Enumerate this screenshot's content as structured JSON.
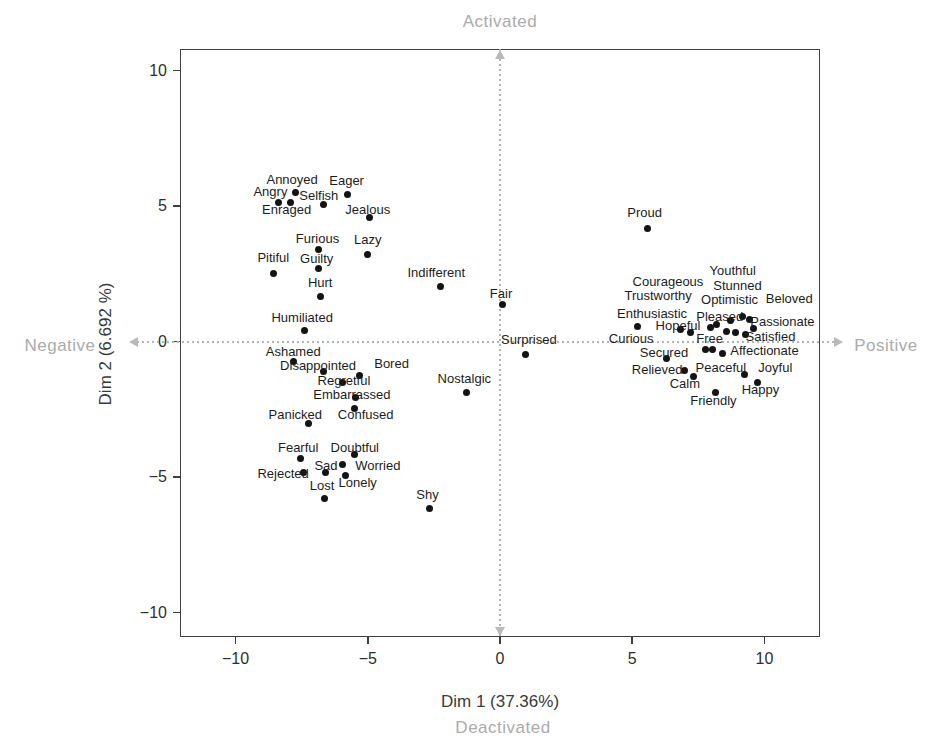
{
  "colors": {
    "point": "#141414",
    "point_label": "#1c1c1c",
    "axis_title": "#3a3a3a",
    "tick_label": "#2e2e2e",
    "quadrant_label": "#ababab",
    "crosshair": "#b4b4b4",
    "plot_border": "#3f3f3f",
    "background": "#ffffff"
  },
  "chart_data": {
    "type": "scatter",
    "title": "",
    "xlabel": "Dim 1 (37.36%)",
    "ylabel": "Dim 2 (6.692 %)",
    "xlim": [
      -12.1,
      12.1
    ],
    "ylim": [
      -10.9,
      10.8
    ],
    "grid": false,
    "quadrant_labels": {
      "top": "Activated",
      "bottom": "Deactivated",
      "left": "Negative",
      "right": "Positive"
    },
    "x_ticks": [
      {
        "v": -10,
        "label": "−10"
      },
      {
        "v": -5,
        "label": "−5"
      },
      {
        "v": 0,
        "label": "0"
      },
      {
        "v": 5,
        "label": "5"
      },
      {
        "v": 10,
        "label": "10"
      }
    ],
    "y_ticks": [
      {
        "v": -10,
        "label": "−10"
      },
      {
        "v": -5,
        "label": "−5"
      },
      {
        "v": 0,
        "label": "0"
      },
      {
        "v": 5,
        "label": "5"
      },
      {
        "v": 10,
        "label": "10"
      }
    ],
    "points": [
      {
        "label": "Annoyed",
        "x": -7.74,
        "y": 5.49,
        "lx": -7.86,
        "ly": 6.0
      },
      {
        "label": "Eager",
        "x": -5.75,
        "y": 5.42,
        "lx": -5.8,
        "ly": 5.95
      },
      {
        "label": "Angry",
        "x": -8.38,
        "y": 5.13,
        "lx": -8.68,
        "ly": 5.55
      },
      {
        "label": "Enraged",
        "x": -7.93,
        "y": 5.13,
        "lx": -8.07,
        "ly": 4.88
      },
      {
        "label": "Selfish",
        "x": -6.69,
        "y": 5.05,
        "lx": -6.85,
        "ly": 5.4
      },
      {
        "label": "Jealous",
        "x": -4.92,
        "y": 4.58,
        "lx": -5.0,
        "ly": 4.88
      },
      {
        "label": "Furious",
        "x": -6.88,
        "y": 3.41,
        "lx": -6.9,
        "ly": 3.82
      },
      {
        "label": "Lazy",
        "x": -5.0,
        "y": 3.22,
        "lx": -5.0,
        "ly": 3.78
      },
      {
        "label": "Pitiful",
        "x": -8.57,
        "y": 2.53,
        "lx": -8.57,
        "ly": 3.12
      },
      {
        "label": "Guilty",
        "x": -6.88,
        "y": 2.71,
        "lx": -6.93,
        "ly": 3.08
      },
      {
        "label": "Hurt",
        "x": -6.77,
        "y": 1.68,
        "lx": -6.8,
        "ly": 2.2
      },
      {
        "label": "Indifferent",
        "x": -2.26,
        "y": 2.05,
        "lx": -2.41,
        "ly": 2.56
      },
      {
        "label": "Humiliated",
        "x": -7.41,
        "y": 0.4,
        "lx": -7.48,
        "ly": 0.9
      },
      {
        "label": "Fair",
        "x": 0.08,
        "y": 1.36,
        "lx": 0.04,
        "ly": 1.8
      },
      {
        "label": "Surprised",
        "x": 0.98,
        "y": -0.48,
        "lx": 1.09,
        "ly": 0.1
      },
      {
        "label": "Ashamed",
        "x": -7.82,
        "y": -0.73,
        "lx": -7.82,
        "ly": -0.35
      },
      {
        "label": "Disappointed",
        "x": -6.69,
        "y": -1.1,
        "lx": -6.88,
        "ly": -0.88
      },
      {
        "label": "Bored",
        "x": -5.3,
        "y": -1.25,
        "lx": -4.1,
        "ly": -0.78
      },
      {
        "label": "Regretful",
        "x": -5.94,
        "y": -1.52,
        "lx": -5.9,
        "ly": -1.4
      },
      {
        "label": "Embarrassed",
        "x": -5.45,
        "y": -2.06,
        "lx": -5.6,
        "ly": -1.92
      },
      {
        "label": "Confused",
        "x": -5.49,
        "y": -2.47,
        "lx": -5.08,
        "ly": -2.66
      },
      {
        "label": "Panicked",
        "x": -7.26,
        "y": -3.02,
        "lx": -7.74,
        "ly": -2.66
      },
      {
        "label": "Nostalgic",
        "x": -1.28,
        "y": -1.88,
        "lx": -1.35,
        "ly": -1.33
      },
      {
        "label": "Fearful",
        "x": -7.56,
        "y": -4.33,
        "lx": -7.63,
        "ly": -3.9
      },
      {
        "label": "Doubtful",
        "x": -5.49,
        "y": -4.18,
        "lx": -5.49,
        "ly": -3.88
      },
      {
        "label": "Rejected",
        "x": -7.44,
        "y": -4.84,
        "lx": -8.2,
        "ly": -4.86
      },
      {
        "label": "Sad",
        "x": -6.6,
        "y": -4.83,
        "lx": -6.58,
        "ly": -4.56
      },
      {
        "label": "Worried",
        "x": -5.94,
        "y": -4.55,
        "lx": -4.62,
        "ly": -4.56
      },
      {
        "label": "Lonely",
        "x": -5.83,
        "y": -4.95,
        "lx": -5.38,
        "ly": -5.18
      },
      {
        "label": "Lost",
        "x": -6.65,
        "y": -5.78,
        "lx": -6.73,
        "ly": -5.3
      },
      {
        "label": "Shy",
        "x": -2.67,
        "y": -6.14,
        "lx": -2.74,
        "ly": -5.62
      },
      {
        "label": "Proud",
        "x": 5.58,
        "y": 4.19,
        "lx": 5.47,
        "ly": 4.8
      },
      {
        "label": "Curious",
        "x": 5.19,
        "y": 0.55,
        "lx": 4.96,
        "ly": 0.15
      },
      {
        "label": "Hopeful",
        "x": 6.84,
        "y": 0.45,
        "lx": 6.73,
        "ly": 0.6
      },
      {
        "label": "Enthusiastic",
        "x": 7.2,
        "y": 0.33,
        "lx": 5.75,
        "ly": 1.06
      },
      {
        "label": "Trustworthy",
        "x": 7.97,
        "y": 0.51,
        "lx": 5.98,
        "ly": 1.72
      },
      {
        "label": "Courageous",
        "x": 8.2,
        "y": 0.62,
        "lx": 6.35,
        "ly": 2.23
      },
      {
        "label": "Youthful",
        "x": 8.72,
        "y": 0.77,
        "lx": 8.8,
        "ly": 2.64
      },
      {
        "label": "Stunned",
        "x": 9.17,
        "y": 0.92,
        "lx": 8.98,
        "ly": 2.1
      },
      {
        "label": "Optimistic",
        "x": 8.57,
        "y": 0.37,
        "lx": 8.68,
        "ly": 1.58
      },
      {
        "label": "Beloved",
        "x": 9.44,
        "y": 0.81,
        "lx": 10.94,
        "ly": 1.61
      },
      {
        "label": "Pleased",
        "x": 8.91,
        "y": 0.33,
        "lx": 8.31,
        "ly": 0.95
      },
      {
        "label": "Passionate",
        "x": 9.6,
        "y": 0.5,
        "lx": 10.68,
        "ly": 0.77
      },
      {
        "label": "Satisfied",
        "x": 9.3,
        "y": 0.28,
        "lx": 10.23,
        "ly": 0.22
      },
      {
        "label": "Free",
        "x": 7.78,
        "y": -0.3,
        "lx": 7.93,
        "ly": 0.15
      },
      {
        "label": "Secured",
        "x": 6.28,
        "y": -0.62,
        "lx": 6.2,
        "ly": -0.4
      },
      {
        "label": "Affectionate",
        "x": 8.05,
        "y": -0.29,
        "lx": 10.0,
        "ly": -0.29
      },
      {
        "label": "Peaceful",
        "x": 8.42,
        "y": -0.44,
        "lx": 8.35,
        "ly": -0.95
      },
      {
        "label": "Relieved",
        "x": 6.99,
        "y": -1.06,
        "lx": 5.94,
        "ly": -1.0
      },
      {
        "label": "Calm",
        "x": 7.3,
        "y": -1.3,
        "lx": 6.99,
        "ly": -1.52
      },
      {
        "label": "Joyful",
        "x": 9.25,
        "y": -1.21,
        "lx": 10.41,
        "ly": -0.95
      },
      {
        "label": "Happy",
        "x": 9.74,
        "y": -1.5,
        "lx": 9.85,
        "ly": -1.73
      },
      {
        "label": "Friendly",
        "x": 8.14,
        "y": -1.87,
        "lx": 8.07,
        "ly": -2.17
      }
    ]
  }
}
